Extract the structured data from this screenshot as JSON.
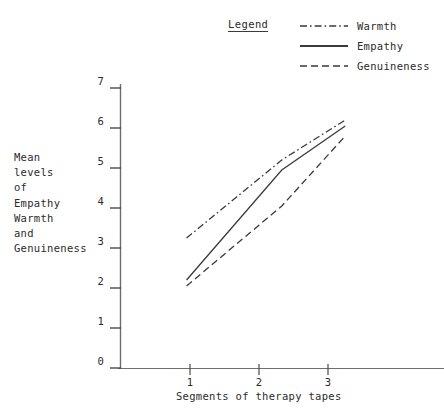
{
  "chart_data": {
    "type": "line",
    "title": "",
    "xlabel": "Segments of therapy tapes",
    "ylabel": "Mean levels of Empathy Warmth and Genuineness",
    "ylabel_lines": [
      "Mean",
      "levels",
      "of",
      "Empathy",
      "Warmth",
      "and",
      "Genuineness"
    ],
    "x": [
      1,
      2,
      3
    ],
    "xtick_labels": [
      "1",
      "2",
      "3"
    ],
    "ytick_labels": [
      "0",
      "1",
      "2",
      "3",
      "4",
      "5",
      "6",
      "7"
    ],
    "xlim": [
      0.95,
      3.25
    ],
    "ylim": [
      0,
      7
    ],
    "grid": false,
    "legend_position": "top-right",
    "legend_title": "Legend",
    "series": [
      {
        "name": "Warmth",
        "style": "dashdot",
        "color": "#3a3a3a",
        "x": [
          0.95,
          2.33,
          3.25
        ],
        "values": [
          3.25,
          5.2,
          6.2
        ]
      },
      {
        "name": "Empathy",
        "style": "solid",
        "color": "#3a3a3a",
        "x": [
          0.95,
          2.33,
          3.25
        ],
        "values": [
          2.2,
          4.95,
          6.05
        ]
      },
      {
        "name": "Genuineness",
        "style": "dashed",
        "color": "#3a3a3a",
        "x": [
          0.95,
          2.33,
          3.25
        ],
        "values": [
          2.05,
          4.05,
          5.8
        ]
      }
    ]
  },
  "legend": {
    "title": "Legend",
    "entries": [
      {
        "label": "Warmth",
        "icon": "dashdot-line-icon"
      },
      {
        "label": "Empathy",
        "icon": "solid-line-icon"
      },
      {
        "label": "Genuineness",
        "icon": "dashed-line-icon"
      }
    ]
  }
}
